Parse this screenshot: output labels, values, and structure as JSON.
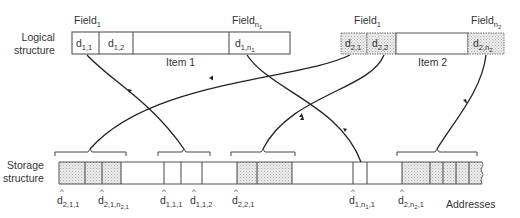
{
  "logical_structure": {
    "label_line1": "Logical",
    "label_line2": "structure",
    "items": [
      {
        "name": "Item 1",
        "field_first": {
          "base": "Field",
          "sub": "1"
        },
        "field_last": {
          "base": "Field",
          "sub": "n",
          "subsub": "1"
        },
        "cells": [
          {
            "base": "d",
            "sub": "1,1"
          },
          {
            "base": "d",
            "sub": "1,2"
          },
          {
            "base": "",
            "sub": ""
          },
          {
            "base": "d",
            "sub": "1,n",
            "subsub": "1"
          }
        ]
      },
      {
        "name": "Item 2",
        "field_first": {
          "base": "Field",
          "sub": "1"
        },
        "field_last": {
          "base": "Field",
          "sub": "n",
          "subsub": "2"
        },
        "cells": [
          {
            "base": "d",
            "sub": "2,1"
          },
          {
            "base": "d",
            "sub": "2,2"
          },
          {
            "base": "",
            "sub": ""
          },
          {
            "base": "d",
            "sub": "2,n",
            "subsub": "2"
          }
        ]
      }
    ]
  },
  "storage_structure": {
    "label_line1": "Storage",
    "label_line2": "structure",
    "addresses_label": "Addresses",
    "address_markers": [
      {
        "hat": "^",
        "base": "d",
        "sub": "2,1,1"
      },
      {
        "hat": "^",
        "base": "d",
        "sub": "2,1,n",
        "subsub": "2,1"
      },
      {
        "hat": "^",
        "base": "d",
        "sub": "1,1,1"
      },
      {
        "hat": "^",
        "base": "d",
        "sub": "1,1,2"
      },
      {
        "hat": "^",
        "base": "d",
        "sub": "2,2,1"
      },
      {
        "hat": "^",
        "base": "d",
        "sub": "1,n",
        "subsub": "1",
        "tail": ",1"
      },
      {
        "hat": "^",
        "base": "d",
        "sub": "2,n",
        "subsub": "2",
        "tail": ",1"
      }
    ]
  },
  "colors": {
    "line": "#2a2a2a",
    "shade": "#d9d9d9",
    "text": "#333333"
  }
}
